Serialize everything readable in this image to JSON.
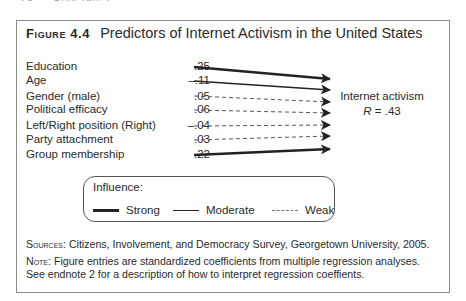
{
  "page_header": {
    "page_number": "70",
    "chapter": "Chapter 4"
  },
  "figure": {
    "label": "Figure 4.4",
    "title": "Predictors of Internet Activism in the United States"
  },
  "predictors": [
    {
      "label": "Education",
      "coef": ".25",
      "strength": "strong"
    },
    {
      "label": "Age",
      "coef": "–.11",
      "strength": "moderate"
    },
    {
      "label": "Gender (male)",
      "coef": ".05",
      "strength": "weak"
    },
    {
      "label": "Political efficacy",
      "coef": ".06",
      "strength": "weak"
    },
    {
      "label": "Left/Right position (Right)",
      "coef": "–.04",
      "strength": "weak"
    },
    {
      "label": "Party attachment",
      "coef": ".03",
      "strength": "weak"
    },
    {
      "label": "Group membership",
      "coef": ".22",
      "strength": "strong"
    }
  ],
  "outcome": {
    "label": "Internet activism",
    "r_symbol": "R",
    "r_value": " = .43"
  },
  "legend": {
    "title": "Influence:",
    "items": [
      {
        "label": "Strong",
        "style": "strong"
      },
      {
        "label": "Moderate",
        "style": "moderate"
      },
      {
        "label": "Weak",
        "style": "weak"
      }
    ]
  },
  "sources": {
    "prefix": "Sources:",
    "text": " Citizens, Involvement, and Democracy Survey, Georgetown University, 2005."
  },
  "note": {
    "prefix": "Note:",
    "line1": " Figure entries are standardized coefficients from multiple regression analyses.",
    "line2": "See endnote 2 for a description of how to interpret regression coeffients."
  },
  "colors": {
    "line": "#222222",
    "weak_line": "#666666",
    "frame": "#8a8a8a",
    "text": "#2a2a2a"
  }
}
